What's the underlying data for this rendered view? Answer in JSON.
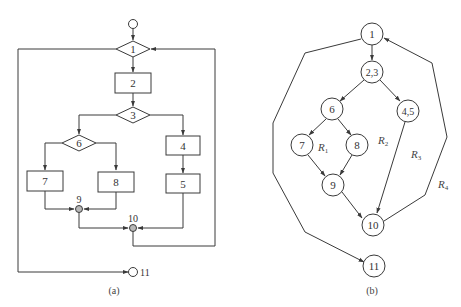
{
  "flowchart": {
    "caption": "(a)",
    "nodes": {
      "start": "",
      "n1": "1",
      "n2": "2",
      "n3": "3",
      "n4": "4",
      "n5": "5",
      "n6": "6",
      "n7": "7",
      "n8": "8",
      "n9": "9",
      "n10": "10",
      "n11": "11"
    }
  },
  "flowgraph": {
    "caption": "(b)",
    "nodes": {
      "n1": "1",
      "n23": "2,3",
      "n45": "4,5",
      "n6": "6",
      "n7": "7",
      "n8": "8",
      "n9": "9",
      "n10": "10",
      "n11": "11"
    },
    "regions": {
      "r1": {
        "main": "R",
        "sub": "1"
      },
      "r2": {
        "main": "R",
        "sub": "2"
      },
      "r3": {
        "main": "R",
        "sub": "3"
      },
      "r4": {
        "main": "R",
        "sub": "4"
      }
    },
    "edges": [
      [
        "1",
        "2,3"
      ],
      [
        "2,3",
        "6"
      ],
      [
        "2,3",
        "4,5"
      ],
      [
        "6",
        "7"
      ],
      [
        "6",
        "8"
      ],
      [
        "7",
        "9"
      ],
      [
        "8",
        "9"
      ],
      [
        "9",
        "10"
      ],
      [
        "4,5",
        "10"
      ],
      [
        "10",
        "1"
      ],
      [
        "1",
        "11"
      ]
    ]
  },
  "colors": {
    "line": "#3a3a3a",
    "junction_fill": "#b8b8b8",
    "background": "#ffffff"
  }
}
